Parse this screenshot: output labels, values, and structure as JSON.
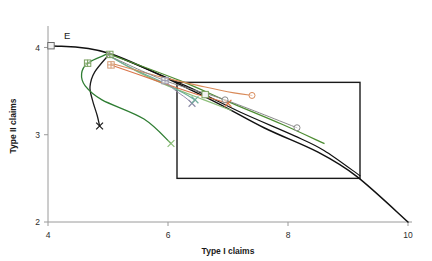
{
  "chart_data": {
    "type": "line",
    "title": "",
    "xlabel": "Type I claims",
    "ylabel": "Type II claims",
    "xlim": [
      4,
      10
    ],
    "ylim": [
      2,
      4.2
    ],
    "xticks": [
      4,
      6,
      8,
      10
    ],
    "yticks": [
      2,
      3,
      4
    ],
    "xtick_labels": [
      "4",
      "6",
      "8",
      "10"
    ],
    "ytick_labels": [
      "2",
      "3",
      "4"
    ],
    "grid": false,
    "legend": "none",
    "annotations": [
      {
        "name": "point-E",
        "label": "E",
        "x": 4.05,
        "y": 4.02,
        "marker": "square"
      }
    ],
    "regions": [
      {
        "name": "reference-box",
        "x0": 6.15,
        "y0": 2.5,
        "x1": 9.2,
        "y1": 3.6,
        "stroke": "#1a1a1a",
        "fill": "none"
      }
    ],
    "series": [
      {
        "name": "frontier-black",
        "color": "#111111",
        "width": 1.5,
        "marker": "none",
        "points": [
          [
            4.05,
            4.02
          ],
          [
            5.03,
            3.93
          ],
          [
            6.6,
            3.44
          ],
          [
            7.6,
            3.08
          ],
          [
            8.5,
            2.8
          ],
          [
            9.15,
            2.52
          ],
          [
            10.0,
            2.0
          ]
        ]
      },
      {
        "name": "frontier-black-inner",
        "color": "#111111",
        "width": 1.2,
        "marker": "none",
        "points": [
          [
            5.03,
            3.93
          ],
          [
            6.3,
            3.56
          ],
          [
            7.2,
            3.26
          ],
          [
            8.1,
            2.99
          ],
          [
            8.6,
            2.82
          ],
          [
            9.2,
            2.53
          ]
        ]
      },
      {
        "name": "curve-black-hook",
        "color": "#1a1a1a",
        "width": 1.3,
        "marker": "x",
        "points": [
          [
            5.03,
            3.93
          ],
          [
            4.78,
            3.72
          ],
          [
            4.7,
            3.55
          ],
          [
            4.74,
            3.4
          ],
          [
            4.82,
            3.22
          ],
          [
            4.86,
            3.1
          ]
        ]
      },
      {
        "name": "curve-green-dark",
        "color": "#2e7d32",
        "width": 1.3,
        "marker": "plus",
        "points": [
          [
            4.97,
            3.92
          ],
          [
            4.66,
            3.82
          ],
          [
            4.56,
            3.7
          ],
          [
            4.62,
            3.56
          ],
          [
            4.9,
            3.4
          ],
          [
            5.6,
            3.18
          ],
          [
            6.05,
            2.9
          ]
        ]
      },
      {
        "name": "curve-green-mid",
        "color": "#4e8d33",
        "width": 1.3,
        "marker": "none",
        "points": [
          [
            5.03,
            3.92
          ],
          [
            6.2,
            3.62
          ],
          [
            7.0,
            3.38
          ],
          [
            7.9,
            3.12
          ],
          [
            8.6,
            2.9
          ]
        ]
      },
      {
        "name": "curve-green-light",
        "color": "#8dbf7a",
        "width": 1.2,
        "marker": "x",
        "points": [
          [
            5.03,
            3.9
          ],
          [
            5.5,
            3.72
          ],
          [
            6.0,
            3.56
          ],
          [
            6.6,
            3.4
          ],
          [
            7.05,
            3.28
          ]
        ]
      },
      {
        "name": "curve-teal",
        "color": "#6fae9a",
        "width": 1.2,
        "marker": "x",
        "points": [
          [
            5.03,
            3.9
          ],
          [
            5.4,
            3.76
          ],
          [
            5.85,
            3.62
          ],
          [
            6.25,
            3.48
          ],
          [
            6.45,
            3.4
          ]
        ]
      },
      {
        "name": "curve-orange",
        "color": "#d98b5a",
        "width": 1.1,
        "marker": "circle",
        "points": [
          [
            5.05,
            3.82
          ],
          [
            5.9,
            3.66
          ],
          [
            6.6,
            3.55
          ],
          [
            7.1,
            3.48
          ],
          [
            7.4,
            3.45
          ]
        ]
      },
      {
        "name": "curve-orange-x",
        "color": "#d9754a",
        "width": 1.1,
        "marker": "x",
        "points": [
          [
            5.05,
            3.8
          ],
          [
            5.8,
            3.62
          ],
          [
            6.4,
            3.48
          ],
          [
            6.8,
            3.4
          ],
          [
            7.0,
            3.36
          ]
        ]
      },
      {
        "name": "curve-gray-purple",
        "color": "#9a8fae",
        "width": 1.0,
        "marker": "x",
        "points": [
          [
            5.95,
            3.62
          ],
          [
            6.1,
            3.52
          ],
          [
            6.3,
            3.42
          ],
          [
            6.4,
            3.36
          ]
        ]
      },
      {
        "name": "curve-gray-circles",
        "color": "#8a8a8a",
        "width": 1.0,
        "marker": "circle",
        "points": [
          [
            5.03,
            3.9
          ],
          [
            5.95,
            3.62
          ],
          [
            6.95,
            3.4
          ],
          [
            8.15,
            3.08
          ]
        ]
      }
    ],
    "markers": [
      {
        "name": "marker-E-square",
        "x": 4.05,
        "y": 4.02,
        "shape": "square",
        "color": "#6b6b6b"
      },
      {
        "name": "marker-node-green",
        "x": 5.03,
        "y": 3.92,
        "shape": "plus",
        "color": "#7aa05f"
      },
      {
        "name": "marker-node-green2",
        "x": 4.66,
        "y": 3.82,
        "shape": "plus",
        "color": "#7aa05f"
      },
      {
        "name": "marker-node-tan",
        "x": 5.05,
        "y": 3.8,
        "shape": "plus",
        "color": "#d49a72"
      },
      {
        "name": "marker-mid-gray",
        "x": 5.95,
        "y": 3.62,
        "shape": "plus",
        "color": "#9a9ab0"
      },
      {
        "name": "marker-x-purple",
        "x": 6.4,
        "y": 3.36,
        "shape": "x",
        "color": "#8a8aa5"
      },
      {
        "name": "marker-x-black",
        "x": 4.86,
        "y": 3.1,
        "shape": "x",
        "color": "#1a1a1a"
      },
      {
        "name": "marker-x-green",
        "x": 6.05,
        "y": 2.9,
        "shape": "x",
        "color": "#8dbf7a"
      },
      {
        "name": "marker-x-teal",
        "x": 6.45,
        "y": 3.4,
        "shape": "x",
        "color": "#6fae9a"
      },
      {
        "name": "marker-x-orange",
        "x": 7.0,
        "y": 3.36,
        "shape": "x",
        "color": "#d9754a"
      },
      {
        "name": "marker-circ-orange",
        "x": 7.4,
        "y": 3.45,
        "shape": "circle",
        "color": "#d98b5a"
      },
      {
        "name": "marker-circ-gray1",
        "x": 6.95,
        "y": 3.4,
        "shape": "circle",
        "color": "#8a8a8a"
      },
      {
        "name": "marker-circ-gray2",
        "x": 8.15,
        "y": 3.08,
        "shape": "circle",
        "color": "#8a8a8a"
      },
      {
        "name": "marker-sq-green",
        "x": 6.62,
        "y": 3.46,
        "shape": "square",
        "color": "#7aa05f"
      }
    ]
  }
}
